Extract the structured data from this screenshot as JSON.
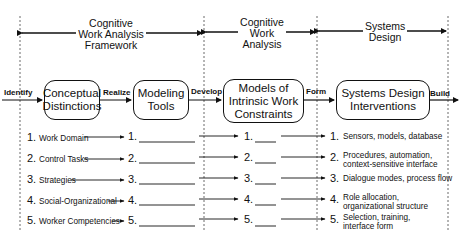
{
  "phases": [
    {
      "label": "Cognitive\nWork Analysis\nFramework"
    },
    {
      "label": "Cognitive\nWork\nAnalysis"
    },
    {
      "label": "Systems\nDesign"
    }
  ],
  "flow": {
    "boxes": [
      "Conceptual\nDistinctions",
      "Modeling\nTools",
      "Models of\nIntrinsic Work\nConstraints",
      "Systems Design\nInterventions"
    ],
    "verbs": [
      "Identify",
      "Realize",
      "Develop",
      "Form",
      "Build"
    ]
  },
  "rows": [
    {
      "num": "1.",
      "label": "Work Domain",
      "tool": "1.",
      "model": "1.",
      "design_num": "1.",
      "design": "Sensors, models, database"
    },
    {
      "num": "2.",
      "label": "Control Tasks",
      "tool": "2.",
      "model": "2.",
      "design_num": "2.",
      "design": "Procedures, automation,\ncontext-sensitive interface"
    },
    {
      "num": "3.",
      "label": "Strategies",
      "tool": "3.",
      "model": "3.",
      "design_num": "3.",
      "design": "Dialogue modes, process flow"
    },
    {
      "num": "4.",
      "label": "Social-Organizational",
      "tool": "4.",
      "model": "4.",
      "design_num": "4.",
      "design": "Role allocation,\norganizational structure"
    },
    {
      "num": "5.",
      "label": "Worker Competencies",
      "tool": "5.",
      "model": "5.",
      "design_num": "5.",
      "design": "Selection, training,\ninterface form"
    }
  ]
}
